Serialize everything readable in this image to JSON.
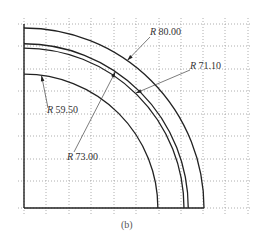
{
  "figure": {
    "caption": "(b)",
    "origin_px": [
      24,
      208
    ],
    "scale_px_per_unit": 2.25,
    "grid": {
      "style": "dotted",
      "color": "#9a9a9a",
      "x_lines_px": [
        24,
        46,
        69,
        91,
        114,
        136,
        159,
        181,
        203,
        225,
        248
      ],
      "y_lines_px": [
        24,
        46,
        69,
        91,
        114,
        136,
        159,
        181,
        208
      ]
    },
    "arcs": [
      {
        "name": "R80",
        "radius": 80.0
      },
      {
        "name": "R73",
        "radius": 73.0
      },
      {
        "name": "R71.1",
        "radius": 71.1
      },
      {
        "name": "R59.5",
        "radius": 59.5
      }
    ],
    "dimensions": [
      {
        "prefix": "R",
        "value": "80.00",
        "label_x": 150,
        "label_y": 27
      },
      {
        "prefix": "R",
        "value": "71.10",
        "label_x": 190,
        "label_y": 61
      },
      {
        "prefix": "R",
        "value": "59.50",
        "label_x": 47,
        "label_y": 105
      },
      {
        "prefix": "R",
        "value": "73.00",
        "label_x": 67,
        "label_y": 152
      }
    ],
    "line_color": "#222222"
  }
}
